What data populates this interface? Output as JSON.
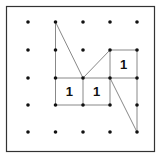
{
  "diagram": {
    "type": "geoboard-dot-grid",
    "grid": {
      "cols": 5,
      "rows": 5
    },
    "frame_color": "#333333",
    "dot_color": "#111111",
    "line_color": "#888888",
    "segments": [
      {
        "from": [
          1,
          0
        ],
        "to": [
          2,
          2
        ]
      },
      {
        "from": [
          1,
          0
        ],
        "to": [
          1,
          3
        ]
      },
      {
        "from": [
          1,
          2
        ],
        "to": [
          4,
          2
        ]
      },
      {
        "from": [
          1,
          3
        ],
        "to": [
          3,
          3
        ]
      },
      {
        "from": [
          2,
          2
        ],
        "to": [
          2,
          3
        ]
      },
      {
        "from": [
          2,
          2
        ],
        "to": [
          3,
          1
        ]
      },
      {
        "from": [
          3,
          1
        ],
        "to": [
          4,
          1
        ]
      },
      {
        "from": [
          3,
          1
        ],
        "to": [
          3,
          3
        ]
      },
      {
        "from": [
          4,
          1
        ],
        "to": [
          4,
          4
        ]
      },
      {
        "from": [
          3,
          2
        ],
        "to": [
          4,
          4
        ]
      }
    ],
    "labels": [
      {
        "text": "1",
        "cell": [
          1,
          2
        ]
      },
      {
        "text": "1",
        "cell": [
          2,
          2
        ]
      },
      {
        "text": "1",
        "cell": [
          3,
          1
        ]
      }
    ]
  }
}
